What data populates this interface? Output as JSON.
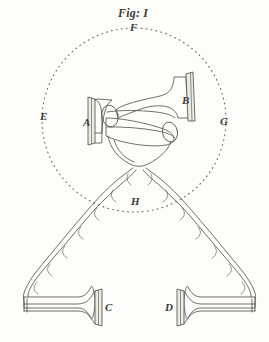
{
  "figure": {
    "title": "Fig: I",
    "background_color": "#fdfdfb",
    "ink_color": "#55544e",
    "label_color": "#3b3b38"
  },
  "labels": {
    "top_f": "F",
    "left_e": "E",
    "right_g": "G",
    "bottom_h": "H",
    "left_horn_a": "A",
    "right_horn_b": "B",
    "lower_left_horn_c": "C",
    "lower_right_horn_d": "D"
  },
  "parts": [
    {
      "id": "A",
      "name": "left-horn-bell",
      "label": "A"
    },
    {
      "id": "B",
      "name": "right-horn-bell",
      "label": "B"
    },
    {
      "id": "C",
      "name": "lower-left-trumpet",
      "label": "C"
    },
    {
      "id": "D",
      "name": "lower-right-trumpet",
      "label": "D"
    },
    {
      "id": "E",
      "name": "circle-left-point",
      "label": "E"
    },
    {
      "id": "F",
      "name": "circle-top-point",
      "label": "F"
    },
    {
      "id": "G",
      "name": "circle-right-point",
      "label": "G"
    },
    {
      "id": "H",
      "name": "circle-bottom-point",
      "label": "H"
    }
  ],
  "geometry": {
    "dotted_circle": {
      "cx": 134,
      "cy": 120,
      "r": 92
    },
    "canvas": {
      "width": 269,
      "height": 342
    }
  }
}
